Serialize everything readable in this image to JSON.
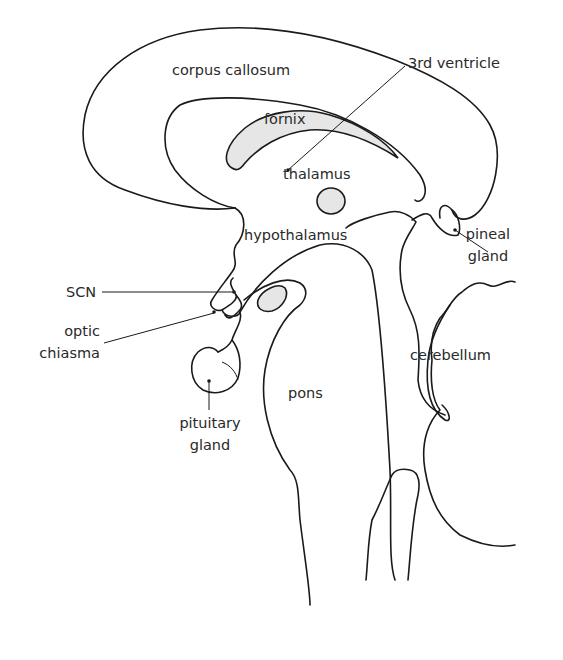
{
  "diagram": {
    "colors": {
      "stroke": "#1a1a1a",
      "shading": "#e6e6e6",
      "text": "#2a2a2a",
      "background": "#ffffff"
    },
    "labels": {
      "corpus_callosum": "corpus callosum",
      "third_ventricle": "3rd ventricle",
      "fornix": "fornix",
      "thalamus": "thalamus",
      "hypothalamus": "hypothalamus",
      "pineal_line1": "pineal",
      "pineal_line2": "gland",
      "scn": "SCN",
      "optic_line1": "optic",
      "optic_line2": "chiasma",
      "cerebellum": "cerebellum",
      "pons": "pons",
      "pituitary_line1": "pituitary",
      "pituitary_line2": "gland"
    }
  }
}
